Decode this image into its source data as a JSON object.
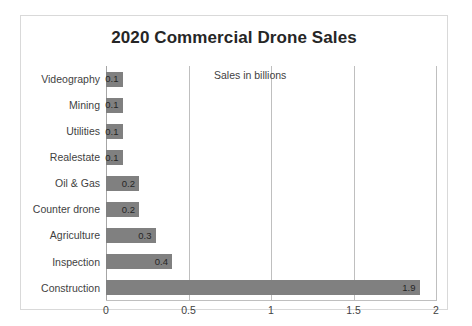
{
  "chart_data": {
    "type": "bar",
    "orientation": "horizontal",
    "title": "2020 Commercial Drone Sales",
    "annotation": "Sales in billions",
    "xlabel": "",
    "ylabel": "",
    "xlim": [
      0,
      2
    ],
    "xticks": [
      "0",
      "0.5",
      "1",
      "1.5",
      "2"
    ],
    "xtick_values": [
      0,
      0.5,
      1,
      1.5,
      2
    ],
    "grid": true,
    "legend": "none",
    "bar_color": "#808080",
    "categories": [
      "Videography",
      "Mining",
      "Utilities",
      "Realestate",
      "Oil & Gas",
      "Counter drone",
      "Agriculture",
      "Inspection",
      "Construction"
    ],
    "values": [
      0.1,
      0.1,
      0.1,
      0.1,
      0.2,
      0.2,
      0.3,
      0.4,
      1.9
    ],
    "data_labels": [
      "0.1",
      "0.1",
      "0.1",
      "0.1",
      "0.2",
      "0.2",
      "0.3",
      "0.4",
      "1.9"
    ]
  }
}
